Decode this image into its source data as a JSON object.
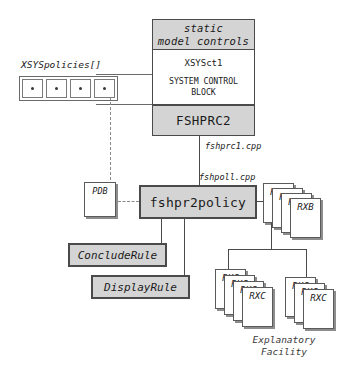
{
  "diagram": {
    "colors": {
      "box_fill": "#d4d4d4",
      "box_stroke": "#4a4a4a",
      "doc_fill": "#ffffff",
      "shadow": "#8d8d8d",
      "dashed": "#8a8a8a",
      "background": "#ffffff"
    }
  },
  "control_block": {
    "header_line1": "static",
    "header_line2": "model controls",
    "class_name": "XSYSct1",
    "description_line1": "SYSTEM CONTROL",
    "description_line2": "BLOCK",
    "process": "FSHPRC2"
  },
  "policies": {
    "label": "XSYSpolicies[]",
    "cells": [
      "*",
      "*",
      "*",
      "*"
    ]
  },
  "labels": {
    "fshprc1": "fshprc1.cpp",
    "fshpoll": "fshpoll.cpp"
  },
  "policy_box": {
    "name": "fshpr2policy"
  },
  "rules": [
    {
      "name": "ConcludeRule"
    },
    {
      "name": "DisplayRule"
    }
  ],
  "documents": {
    "pdb": {
      "label": "PDB"
    },
    "rxb_stack": {
      "label": "RXB",
      "count": 4
    },
    "rxc_stack_left": {
      "label": "RXC",
      "count": 4
    },
    "rxc_stack_right": {
      "label": "RXC",
      "count": 3
    }
  },
  "explanatory": {
    "line1": "Explanatory",
    "line2": "Facility"
  }
}
